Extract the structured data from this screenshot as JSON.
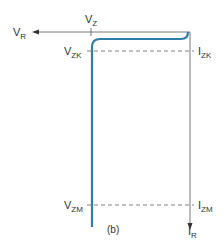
{
  "figure": {
    "caption": "(b)",
    "type": "Zener diode reverse-bias characteristic curve",
    "curve_color": "#2f7ea8",
    "axis_color": "#444444"
  },
  "axes": {
    "x_axis": {
      "label_main": "V",
      "label_sub": "R",
      "direction": "left"
    },
    "y_axis": {
      "label_main": "I",
      "label_sub": "R",
      "direction": "down"
    }
  },
  "labels": {
    "vz": {
      "main": "V",
      "sub": "Z"
    },
    "vzk": {
      "main": "V",
      "sub": "ZK"
    },
    "izk": {
      "main": "I",
      "sub": "ZK"
    },
    "vzm": {
      "main": "V",
      "sub": "ZM"
    },
    "izm": {
      "main": "I",
      "sub": "ZM"
    }
  }
}
